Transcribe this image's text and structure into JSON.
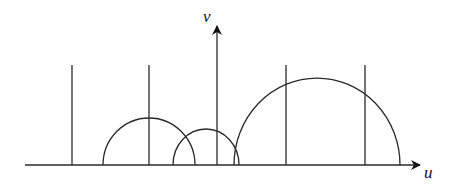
{
  "diagram": {
    "axes": {
      "horizontal_label": "u",
      "vertical_label": "v"
    },
    "elements": {
      "vertical_lines": 4,
      "semicircles": 3
    },
    "colors": {
      "line": "#2a2a2a",
      "background": "#ffffff"
    }
  }
}
